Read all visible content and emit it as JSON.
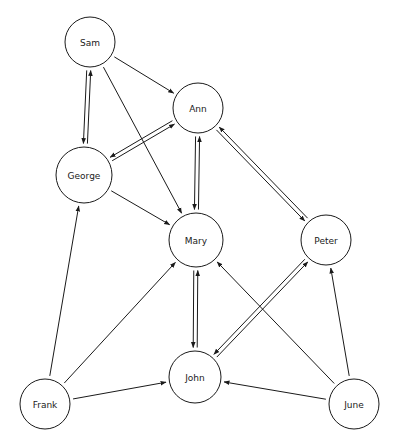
{
  "diagram": {
    "title": "",
    "type": "directed-graph",
    "background_color": "#ffffff",
    "node_fill_color": "#ffffff",
    "node_stroke_color": "#1a1a1a",
    "edge_color": "#1a1a1a",
    "label_color": "#1a1a1a"
  },
  "nodes": [
    {
      "id": "sam",
      "label": "Sam",
      "x": 90,
      "y": 42,
      "r": 25
    },
    {
      "id": "ann",
      "label": "Ann",
      "x": 198,
      "y": 108,
      "r": 25
    },
    {
      "id": "george",
      "label": "George",
      "x": 84,
      "y": 175,
      "r": 28
    },
    {
      "id": "mary",
      "label": "Mary",
      "x": 196,
      "y": 240,
      "r": 27
    },
    {
      "id": "peter",
      "label": "Peter",
      "x": 326,
      "y": 240,
      "r": 25
    },
    {
      "id": "john",
      "label": "John",
      "x": 195,
      "y": 377,
      "r": 26
    },
    {
      "id": "frank",
      "label": "Frank",
      "x": 45,
      "y": 404,
      "r": 25
    },
    {
      "id": "june",
      "label": "June",
      "x": 354,
      "y": 404,
      "r": 25
    }
  ],
  "edges": [
    {
      "from": "sam",
      "to": "george",
      "bidirectional": true,
      "offset": 4
    },
    {
      "from": "sam",
      "to": "ann",
      "bidirectional": false,
      "offset": 0
    },
    {
      "from": "sam",
      "to": "mary",
      "bidirectional": false,
      "offset": 0
    },
    {
      "from": "george",
      "to": "ann",
      "bidirectional": true,
      "offset": 4
    },
    {
      "from": "george",
      "to": "mary",
      "bidirectional": false,
      "offset": 0
    },
    {
      "from": "ann",
      "to": "mary",
      "bidirectional": true,
      "offset": 4
    },
    {
      "from": "ann",
      "to": "peter",
      "bidirectional": true,
      "offset": 4
    },
    {
      "from": "mary",
      "to": "john",
      "bidirectional": true,
      "offset": 4
    },
    {
      "from": "john",
      "to": "peter",
      "bidirectional": true,
      "offset": 4
    },
    {
      "from": "frank",
      "to": "george",
      "bidirectional": false,
      "offset": 0
    },
    {
      "from": "frank",
      "to": "mary",
      "bidirectional": false,
      "offset": 0
    },
    {
      "from": "frank",
      "to": "john",
      "bidirectional": false,
      "offset": 0
    },
    {
      "from": "june",
      "to": "john",
      "bidirectional": false,
      "offset": 0
    },
    {
      "from": "june",
      "to": "peter",
      "bidirectional": false,
      "offset": 0
    },
    {
      "from": "june",
      "to": "mary",
      "bidirectional": false,
      "offset": 0
    }
  ]
}
